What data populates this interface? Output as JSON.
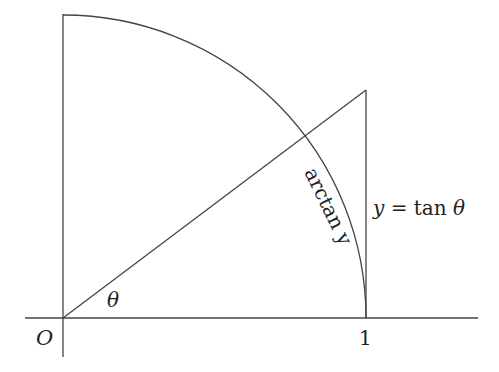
{
  "diagram": {
    "labels": {
      "origin": "O",
      "angle": "θ",
      "unit": "1",
      "tangent_eq_lhs": "y",
      "tangent_eq_mid": " = tan ",
      "tangent_eq_theta": "θ",
      "arc_label": "arctan y"
    },
    "geometry": {
      "origin_px": [
        63,
        318
      ],
      "radius_px": 303,
      "tangent_top_px": [
        366,
        90
      ],
      "stroke_color": "#444444"
    }
  }
}
